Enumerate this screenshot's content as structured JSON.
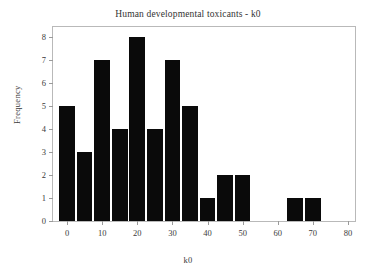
{
  "chart_data": {
    "type": "bar",
    "title": "Human developmental toxicants - k0",
    "xlabel": "k0",
    "ylabel": "Frequency",
    "xlim": [
      -4,
      82
    ],
    "ylim": [
      0,
      8.45
    ],
    "grid": false,
    "legend": null,
    "bin_width": 5,
    "bar_color": "#0a0a0a",
    "frame_color": "#b9b9b9",
    "text_color": "#3a3a3a",
    "xticks": [
      0,
      10,
      20,
      30,
      40,
      50,
      60,
      70,
      80
    ],
    "xtick_labels": [
      "0",
      "10",
      "20",
      "30",
      "40",
      "50",
      "60",
      "70",
      "80"
    ],
    "yticks": [
      0,
      1,
      2,
      3,
      4,
      5,
      6,
      7,
      8
    ],
    "ytick_labels": [
      "0",
      "1",
      "2",
      "3",
      "4",
      "5",
      "6",
      "7",
      "8"
    ],
    "categories": [
      "0",
      "5",
      "10",
      "15",
      "20",
      "25",
      "30",
      "35",
      "40",
      "45",
      "50",
      "65",
      "70"
    ],
    "values": [
      5,
      3,
      7,
      4,
      8,
      4,
      7,
      5,
      1,
      2,
      2,
      1,
      1
    ],
    "bars": [
      {
        "center": 0,
        "value": 5
      },
      {
        "center": 5,
        "value": 3
      },
      {
        "center": 10,
        "value": 7
      },
      {
        "center": 15,
        "value": 4
      },
      {
        "center": 20,
        "value": 8
      },
      {
        "center": 25,
        "value": 4
      },
      {
        "center": 30,
        "value": 7
      },
      {
        "center": 35,
        "value": 5
      },
      {
        "center": 40,
        "value": 1
      },
      {
        "center": 45,
        "value": 2
      },
      {
        "center": 50,
        "value": 2
      },
      {
        "center": 65,
        "value": 1
      },
      {
        "center": 70,
        "value": 1
      }
    ]
  }
}
